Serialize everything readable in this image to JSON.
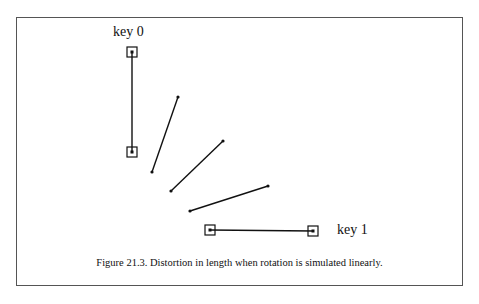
{
  "figure": {
    "caption": "Figure 21.3.  Distortion in length when rotation is simulated linearly.",
    "labels": {
      "key0": "key 0",
      "key1": "key 1"
    }
  },
  "diagram": {
    "line_color": "#111111",
    "key_frames": [
      {
        "name": "key 0",
        "x1": 132,
        "y1": 52,
        "x2": 132,
        "y2": 152
      },
      {
        "name": "key 1",
        "x1": 210,
        "y1": 230,
        "x2": 313,
        "y2": 231
      }
    ],
    "interpolated_segments": [
      {
        "x1": 178,
        "y1": 97,
        "x2": 152,
        "y2": 172
      },
      {
        "x1": 223,
        "y1": 141,
        "x2": 171,
        "y2": 191
      },
      {
        "x1": 268,
        "y1": 186,
        "x2": 190,
        "y2": 211
      }
    ]
  }
}
